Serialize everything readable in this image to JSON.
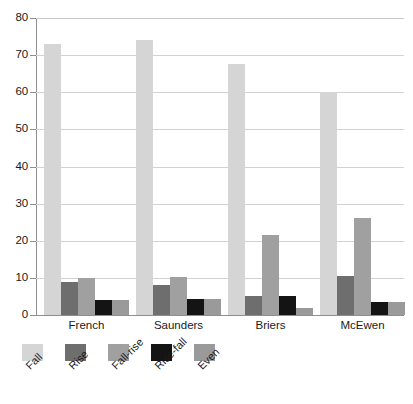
{
  "chart_data": {
    "type": "bar",
    "title": "",
    "subtitle": "",
    "xlabel": "",
    "ylabel": "",
    "categories": [
      "French",
      "Saunders",
      "Briers",
      "McEwen"
    ],
    "series": [
      {
        "name": "Fall",
        "color": "#d5d5d5",
        "values": [
          73,
          74,
          67.5,
          60
        ]
      },
      {
        "name": "Rise",
        "color": "#6e6e6e",
        "values": [
          9,
          8,
          5,
          10.5
        ]
      },
      {
        "name": "Fall-rise",
        "color": "#a0a0a0",
        "values": [
          10,
          10.2,
          21.5,
          26
        ]
      },
      {
        "name": "Rise-fall",
        "color": "#141414",
        "values": [
          4,
          4.2,
          5.2,
          3.5
        ]
      },
      {
        "name": "Even",
        "color": "#9a9a9a",
        "values": [
          4,
          4.2,
          2,
          3.5
        ]
      }
    ],
    "ylim": [
      0,
      80
    ],
    "yticks": [
      0,
      10,
      20,
      30,
      40,
      50,
      60,
      70,
      80
    ],
    "ytick_labels": [
      "0",
      "10",
      "20",
      "30",
      "40",
      "50",
      "60",
      "70",
      "80"
    ],
    "grid": "horizontal",
    "legend_position": "below",
    "axis_color": "#8e8e8e",
    "grid_color": "#d2d2d2",
    "background": "#ffffff"
  }
}
